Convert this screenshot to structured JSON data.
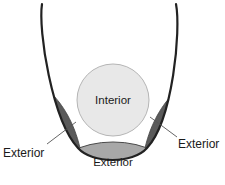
{
  "diagram": {
    "colors": {
      "background": "#ffffff",
      "curve_stroke": "#222222",
      "interior_fill": "#e8e8e8",
      "interior_stroke": "#b5b5b5",
      "petal_fill": "#5a5a5a",
      "petal_stroke": "#3c3c3c",
      "bottom_region_fill": "#a8a8a8",
      "bottom_region_stroke": "#4a4a4a",
      "leader_line": "#555555",
      "label_text": "#1a1a1a"
    },
    "labels": {
      "interior": "Interior",
      "exterior_bottom": "Exterior",
      "exterior_left": "Exterior",
      "exterior_right": "Exterior"
    },
    "shapes": {
      "curve_name": "parabola-opening-upward",
      "interior_circle": {
        "cx": 113,
        "cy": 100,
        "r": 36
      },
      "left_petal_name": "exterior-region-left",
      "right_petal_name": "exterior-region-right",
      "bottom_region_name": "exterior-region-bottom"
    }
  }
}
